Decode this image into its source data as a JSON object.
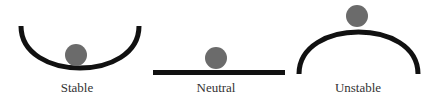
{
  "diagram": {
    "colors": {
      "surface": "#111111",
      "ball": "#6b6b6b",
      "text": "#333333"
    },
    "states": [
      {
        "name": "stable",
        "label": "Stable"
      },
      {
        "name": "neutral",
        "label": "Neutral"
      },
      {
        "name": "unstable",
        "label": "Unstable"
      }
    ]
  }
}
